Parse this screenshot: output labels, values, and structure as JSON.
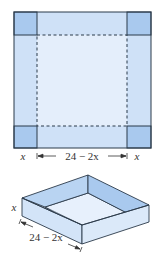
{
  "figure": {
    "flat_sheet": {
      "corner_label_left": "x",
      "corner_label_right": "x",
      "span_label": "24 − 2x"
    },
    "box": {
      "height_label": "x",
      "length_label": "24 − 2x"
    },
    "colors": {
      "corner_square": "#a9c9ee",
      "side_flap": "#cfe1f7",
      "center": "#e4eefb",
      "outline": "#2b3a4a",
      "box_wall_dark": "#a9c9ee",
      "box_wall_light": "#d3e4f8",
      "box_floor": "#e7f0fc"
    }
  }
}
